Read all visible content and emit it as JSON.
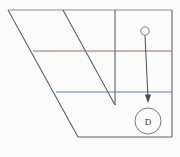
{
  "canvas": {
    "width": 180,
    "height": 157,
    "background_color": "#fbfbfb"
  },
  "colors": {
    "outline": "#595f6b",
    "slant": "#5a5f68",
    "top_edge": "#8a8ea6",
    "upper_divider": "#9a6a6a",
    "lower_divider": "#5a7fbf",
    "arrow": "#4a4a55",
    "label_text": "#3a3a3a",
    "node_stroke": "#7a7a86"
  },
  "figure": {
    "outline": {
      "name": "main-outline",
      "points": "8,10 172,10 172,137 78,137"
    },
    "edges": [
      {
        "name": "top-edge",
        "x1": 8,
        "y1": 10,
        "x2": 172,
        "y2": 10,
        "color_key": "top_edge"
      },
      {
        "name": "left-slant-edge",
        "x1": 8,
        "y1": 10,
        "x2": 78,
        "y2": 137,
        "color_key": "slant"
      },
      {
        "name": "bottom-edge",
        "x1": 78,
        "y1": 137,
        "x2": 172,
        "y2": 137,
        "color_key": "outline"
      },
      {
        "name": "right-vertical-edge",
        "x1": 172,
        "y1": 10,
        "x2": 172,
        "y2": 137,
        "color_key": "outline"
      }
    ],
    "interior_lines": [
      {
        "name": "inner-slant-line",
        "x1": 63,
        "y1": 10,
        "x2": 115,
        "y2": 105,
        "color_key": "slant"
      },
      {
        "name": "inner-vertical-line",
        "x1": 115,
        "y1": 10,
        "x2": 115,
        "y2": 105,
        "color_key": "outline"
      },
      {
        "name": "upper-divider-line",
        "x1": 33,
        "y1": 51,
        "x2": 172,
        "y2": 51,
        "color_key": "upper_divider"
      },
      {
        "name": "lower-divider-line",
        "x1": 56,
        "y1": 92,
        "x2": 172,
        "y2": 92,
        "color_key": "lower_divider"
      }
    ],
    "nodes": [
      {
        "name": "source-node",
        "shape": "circle",
        "cx": 145,
        "cy": 31,
        "r": 4.2,
        "label": "",
        "filled": false
      },
      {
        "name": "target-node-d",
        "shape": "circle",
        "cx": 148,
        "cy": 121,
        "r": 13,
        "label": "D",
        "filled": false
      }
    ],
    "arrow": {
      "name": "connector-arrow",
      "from_x": 145,
      "from_y": 35,
      "to_x": 148,
      "to_y": 101,
      "head_width": 6,
      "head_length": 8,
      "color_key": "arrow"
    }
  }
}
